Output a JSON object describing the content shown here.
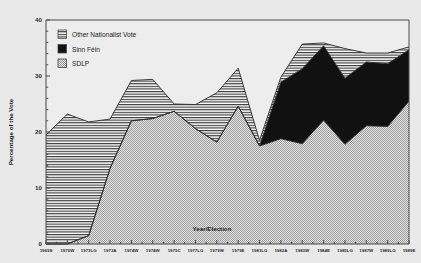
{
  "chart_data": {
    "type": "area",
    "title": "",
    "xlabel": "Year/Election",
    "ylabel": "Percentage of the Vote",
    "ylim": [
      0,
      40
    ],
    "yticks": [
      0,
      10,
      20,
      30,
      40
    ],
    "ytick_labels": [
      "0",
      "10",
      "20",
      "30",
      "40"
    ],
    "grid": false,
    "legend_position": "top-left",
    "stacked": true,
    "categories": [
      "1969S",
      "1970W",
      "1973LG",
      "1973A",
      "1974W",
      "1974W",
      "1975C",
      "1977LG",
      "1979W",
      "1979E",
      "1981LG",
      "1982A",
      "1983W",
      "1984E",
      "1985LG",
      "1987W",
      "1989LG",
      "1989E"
    ],
    "series": [
      {
        "name": "SDLP",
        "fill": "#d6d6d6",
        "pattern": "dots",
        "values": [
          0,
          0,
          1.5,
          13.5,
          22.0,
          22.4,
          23.7,
          20.6,
          18.2,
          24.6,
          17.5,
          18.8,
          17.9,
          22.1,
          17.8,
          21.1,
          21.0,
          25.5
        ]
      },
      {
        "name": "Sinn Féin",
        "fill": "#111111",
        "pattern": "solid",
        "values": [
          0,
          0,
          0,
          0,
          0,
          0,
          0,
          0,
          0,
          0,
          0,
          10.1,
          13.4,
          13.3,
          11.8,
          11.4,
          11.2,
          9.2
        ]
      },
      {
        "name": "Other Nationalist Vote",
        "fill": "#ffffff",
        "pattern": "hlines",
        "values": [
          19.5,
          23.2,
          20.3,
          8.8,
          7.2,
          7.0,
          1.3,
          4.3,
          8.8,
          6.8,
          1.0,
          0.9,
          4.4,
          0.5,
          5.3,
          1.6,
          1.9,
          0.5
        ]
      }
    ],
    "totals": [
      19.5,
      23.2,
      21.8,
      22.3,
      29.2,
      29.4,
      25.0,
      24.9,
      27.0,
      31.4,
      18.5,
      29.8,
      35.7,
      35.9,
      34.9,
      34.1,
      34.1,
      35.2
    ],
    "legend": [
      {
        "label": "Other Nationalist Vote",
        "swatch": "hlines"
      },
      {
        "label": "Sinn Féin",
        "swatch": "solid"
      },
      {
        "label": "SDLP",
        "swatch": "dots"
      }
    ]
  }
}
